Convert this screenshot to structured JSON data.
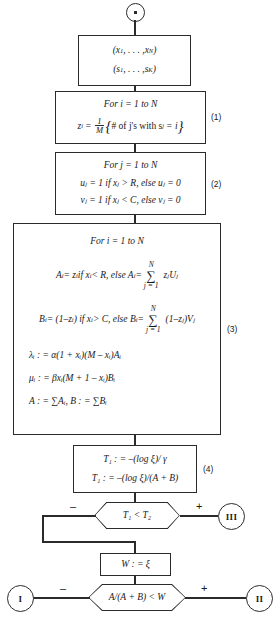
{
  "diagram": {
    "start_node": {
      "name": "start-node",
      "glyph": "•"
    },
    "input_box": {
      "line1_prefix": "(",
      "line1": "x",
      "line1_sub1": "1",
      "line1_mid": ", . . . , ",
      "line1_var2": "x",
      "line1_sub2": "N",
      "line1_suffix": ")",
      "line2_prefix": "(",
      "line2": "s",
      "line2_sub1": "1",
      "line2_mid": ", . . . , ",
      "line2_var2": "s",
      "line2_sub2": "K",
      "line2_suffix": ")"
    },
    "step1": {
      "label": "(1)",
      "header": "For i = 1 to N",
      "formula_lhs": "z",
      "formula_lhs_sub": "i",
      "formula_eq": "=",
      "frac_num": "1",
      "frac_den": "M",
      "brace_open": "{",
      "brace_text": "# of j's with s",
      "brace_sub": "j",
      "brace_eq": "= i",
      "brace_close": "}"
    },
    "step2": {
      "label": "(2)",
      "header": "For j = 1 to N",
      "line1": "uⱼ = 1 if  xⱼ > R, else uⱼ = 0",
      "line2": "vⱼ = 1 if xⱼ < C, else vⱼ = 0"
    },
    "step3": {
      "label": "(3)",
      "header": "For i = 1 to N",
      "lineA_pre": "A",
      "lineA_text": " = z",
      "lineA_cond": " if x",
      "lineA_rel": " < R, else A",
      "lineA_eq": " = ",
      "sumA_top": "N",
      "sumA_bot": "j = 1",
      "lineA_term": "zⱼUⱼ",
      "lineB_pre": "B",
      "lineB_text": " = (1–z",
      "lineB_cond": ") if x",
      "lineB_rel": " > C, else B",
      "lineB_eq": " = ",
      "sumB_top": "N",
      "sumB_bot": "j = 1",
      "lineB_term": "(1–zⱼ)Vⱼ",
      "lambda_line": "λᵢ : = α(1 + xᵢ)(M – xᵢ)Aᵢ",
      "mu_line": "μᵢ : = βxᵢ(M + 1 – xᵢ)Bᵢ",
      "ab_line": "A : = ∑Aᵢ, B : = ∑Bᵢ"
    },
    "step4": {
      "label": "(4)",
      "line1": "T₁ : = –(log ξ)/ γ",
      "line2": "T₁ : = –(log ξ)/(A + B)"
    },
    "decision1": {
      "name": "decision-t1-lt-t2",
      "text": "T₁ < T₂",
      "minus": "–",
      "plus": "+"
    },
    "w_box": {
      "text": "W : = ξ"
    },
    "decision2": {
      "name": "decision-a-over-ab-lt-w",
      "text": "A/(A + B) < W",
      "minus": "–",
      "plus": "+"
    },
    "connectors": {
      "three": "III",
      "one": "I",
      "two": "II"
    }
  }
}
